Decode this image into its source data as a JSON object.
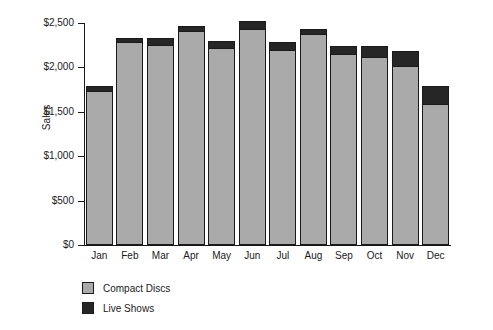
{
  "chart_data": {
    "type": "bar",
    "subtype": "stacked-bar",
    "title": "",
    "xlabel": "",
    "ylabel": "Sales",
    "categories": [
      "Jan",
      "Feb",
      "Mar",
      "Apr",
      "May",
      "Jun",
      "Jul",
      "Aug",
      "Sep",
      "Oct",
      "Nov",
      "Dec"
    ],
    "series": [
      {
        "name": "Compact Discs",
        "color": "#aaaaaa",
        "values": [
          1720,
          2270,
          2240,
          2400,
          2210,
          2420,
          2190,
          2360,
          2135,
          2105,
          2010,
          1580
        ]
      },
      {
        "name": "Live Shows",
        "color": "#262626",
        "values": [
          60,
          55,
          85,
          60,
          75,
          90,
          90,
          60,
          100,
          125,
          165,
          200
        ]
      }
    ],
    "totals": [
      1780,
      2325,
      2325,
      2460,
      2285,
      2510,
      2280,
      2420,
      2235,
      2230,
      2175,
      1780
    ],
    "ylim": [
      0,
      2500
    ],
    "ytick_values": [
      0,
      500,
      1000,
      1500,
      2000,
      2500
    ],
    "ytick_labels": [
      "$0",
      "$500",
      "$1,000",
      "$1,500",
      "$2,000",
      "$2,500"
    ],
    "grid": false,
    "legend_position": "bottom-left",
    "legend_entries": [
      "Compact Discs",
      "Live Shows"
    ]
  },
  "axis": {
    "y_title": "Sales"
  },
  "legend": {
    "items": [
      {
        "label": "Compact Discs",
        "color": "#aaaaaa"
      },
      {
        "label": "Live Shows",
        "color": "#262626"
      }
    ]
  }
}
